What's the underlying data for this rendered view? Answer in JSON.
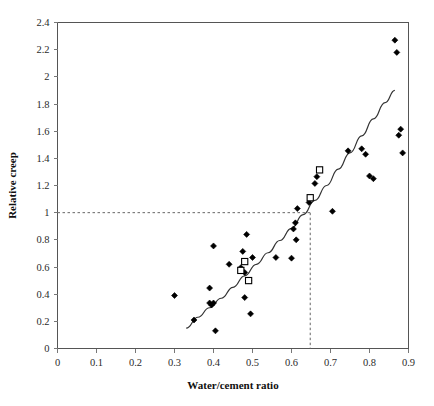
{
  "chart_data": {
    "type": "scatter",
    "title": "",
    "xlabel": "Water/cement ratio",
    "ylabel": "Relative creep",
    "xlim": [
      0,
      0.9
    ],
    "ylim": [
      0,
      2.4
    ],
    "xticks": [
      "0",
      "0.1",
      "0.2",
      "0.3",
      "0.4",
      "0.5",
      "0.6",
      "0.7",
      "0.8",
      "0.9"
    ],
    "xtick_values": [
      0,
      0.1,
      0.2,
      0.3,
      0.4,
      0.5,
      0.6,
      0.7,
      0.8,
      0.9
    ],
    "yticks": [
      "0",
      "0.2",
      "0.4",
      "0.6",
      "0.8",
      "1",
      "1.2",
      "1.4",
      "1.6",
      "1.8",
      "2",
      "2.2",
      "2.4"
    ],
    "ytick_values": [
      0,
      0.2,
      0.4,
      0.6,
      0.8,
      1,
      1.2,
      1.4,
      1.6,
      1.8,
      2,
      2.2,
      2.4
    ],
    "grid": false,
    "legend": null,
    "series": [
      {
        "name": "Measured data",
        "marker": "filled-diamond",
        "color": "#000000",
        "points": [
          [
            0.3,
            0.39
          ],
          [
            0.35,
            0.21
          ],
          [
            0.39,
            0.445
          ],
          [
            0.39,
            0.335
          ],
          [
            0.395,
            0.32
          ],
          [
            0.4,
            0.755
          ],
          [
            0.4,
            0.335
          ],
          [
            0.405,
            0.13
          ],
          [
            0.44,
            0.62
          ],
          [
            0.47,
            0.595
          ],
          [
            0.475,
            0.715
          ],
          [
            0.48,
            0.56
          ],
          [
            0.48,
            0.375
          ],
          [
            0.485,
            0.84
          ],
          [
            0.49,
            0.5
          ],
          [
            0.495,
            0.255
          ],
          [
            0.5,
            0.67
          ],
          [
            0.56,
            0.67
          ],
          [
            0.6,
            0.665
          ],
          [
            0.605,
            0.88
          ],
          [
            0.61,
            0.925
          ],
          [
            0.612,
            0.8
          ],
          [
            0.615,
            1.03
          ],
          [
            0.645,
            1.075
          ],
          [
            0.66,
            1.215
          ],
          [
            0.665,
            1.265
          ],
          [
            0.705,
            1.01
          ],
          [
            0.745,
            1.455
          ],
          [
            0.78,
            1.47
          ],
          [
            0.79,
            1.43
          ],
          [
            0.8,
            1.27
          ],
          [
            0.81,
            1.25
          ],
          [
            0.865,
            2.27
          ],
          [
            0.87,
            2.18
          ],
          [
            0.875,
            1.57
          ],
          [
            0.88,
            1.615
          ],
          [
            0.885,
            1.44
          ]
        ]
      },
      {
        "name": "Predicted data",
        "marker": "open-square",
        "color": "#000000",
        "points": [
          [
            0.47,
            0.575
          ],
          [
            0.48,
            0.64
          ],
          [
            0.49,
            0.5
          ],
          [
            0.648,
            1.11
          ],
          [
            0.672,
            1.315
          ]
        ]
      }
    ],
    "trend_curve": {
      "name": "Fitted curve",
      "points": [
        [
          0.33,
          0.15
        ],
        [
          0.36,
          0.23
        ],
        [
          0.39,
          0.3
        ],
        [
          0.42,
          0.37
        ],
        [
          0.45,
          0.45
        ],
        [
          0.48,
          0.535
        ],
        [
          0.51,
          0.62
        ],
        [
          0.54,
          0.705
        ],
        [
          0.57,
          0.795
        ],
        [
          0.6,
          0.885
        ],
        [
          0.63,
          0.985
        ],
        [
          0.66,
          1.09
        ],
        [
          0.69,
          1.2
        ],
        [
          0.72,
          1.32
        ],
        [
          0.75,
          1.44
        ],
        [
          0.78,
          1.565
        ],
        [
          0.81,
          1.69
        ],
        [
          0.84,
          1.81
        ],
        [
          0.865,
          1.9
        ]
      ]
    },
    "annotations": {
      "guide_y_value": 1.0,
      "guide_x_value": 0.648,
      "guide_style": "dashed",
      "description": "Dashed horizontal guide at relative creep = 1 meeting dashed vertical guide at water/cement ratio = 0.65"
    }
  }
}
